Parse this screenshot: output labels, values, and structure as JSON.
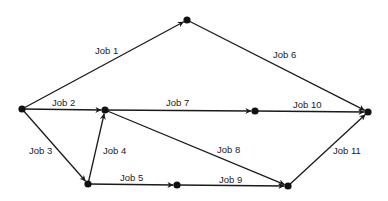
{
  "diagram": {
    "type": "activity-network",
    "nodes": [
      {
        "id": "A",
        "x": 22,
        "y": 109
      },
      {
        "id": "B",
        "x": 187,
        "y": 20
      },
      {
        "id": "C",
        "x": 105,
        "y": 110
      },
      {
        "id": "D",
        "x": 255,
        "y": 111
      },
      {
        "id": "E",
        "x": 368,
        "y": 112
      },
      {
        "id": "F",
        "x": 88,
        "y": 184
      },
      {
        "id": "G",
        "x": 177,
        "y": 185
      },
      {
        "id": "H",
        "x": 288,
        "y": 186
      }
    ],
    "edges": [
      {
        "label": "Job 1",
        "from": "A",
        "to": "B",
        "lx": 95,
        "ly": 54
      },
      {
        "label": "Job 2",
        "from": "A",
        "to": "C",
        "lx": 52,
        "ly": 106
      },
      {
        "label": "Job 3",
        "from": "A",
        "to": "F",
        "lx": 29,
        "ly": 154
      },
      {
        "label": "Job 4",
        "from": "F",
        "to": "C",
        "lx": 103,
        "ly": 154
      },
      {
        "label": "Job 5",
        "from": "F",
        "to": "G",
        "lx": 120,
        "ly": 181
      },
      {
        "label": "Job 6",
        "from": "B",
        "to": "E",
        "lx": 273,
        "ly": 58
      },
      {
        "label": "Job 7",
        "from": "C",
        "to": "D",
        "lx": 166,
        "ly": 106
      },
      {
        "label": "Job 8",
        "from": "C",
        "to": "H",
        "lx": 217,
        "ly": 153
      },
      {
        "label": "Job 9",
        "from": "G",
        "to": "H",
        "lx": 219,
        "ly": 183
      },
      {
        "label": "Job 10",
        "from": "D",
        "to": "E",
        "lx": 293,
        "ly": 108
      },
      {
        "label": "Job 11",
        "from": "H",
        "to": "E",
        "lx": 333,
        "ly": 154
      }
    ]
  }
}
